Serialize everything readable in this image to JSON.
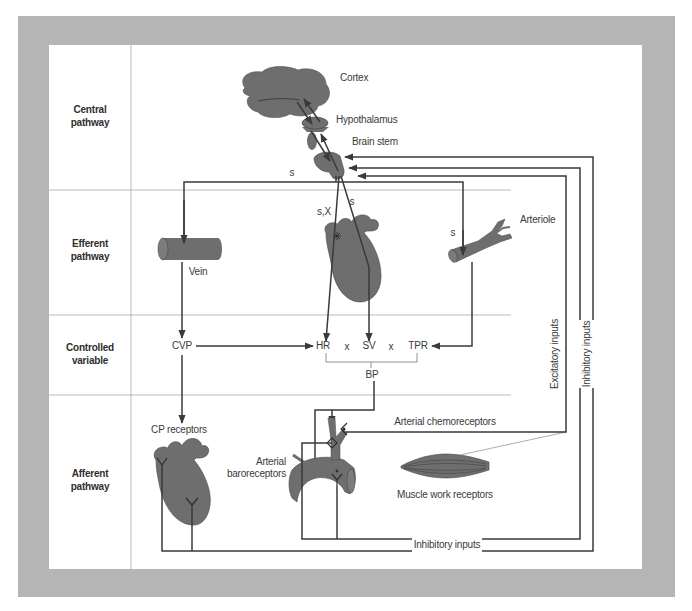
{
  "rows": [
    {
      "line1": "Central",
      "line2": "pathway"
    },
    {
      "line1": "Efferent",
      "line2": "pathway"
    },
    {
      "line1": "Controlled",
      "line2": "variable"
    },
    {
      "line1": "Afferent",
      "line2": "pathway"
    }
  ],
  "central": {
    "cortex": "Cortex",
    "hypothalamus": "Hypothalamus",
    "brain_stem": "Brain stem",
    "sympathetic_label": "s"
  },
  "efferent": {
    "vein": "Vein",
    "arteriole": "Arteriole",
    "heart_rate_nerve_label": "s,X",
    "stroke_volume_nerve_label": "s",
    "arteriole_nerve_label": "s"
  },
  "controlled": {
    "cvp": "CVP",
    "hr": "HR",
    "times_1": "x",
    "sv": "SV",
    "times_2": "x",
    "tpr": "TPR",
    "bp": "BP"
  },
  "afferent": {
    "cp_receptors": "CP receptors",
    "chemoreceptors": "Arterial chemoreceptors",
    "baroreceptors_line1": "Arterial",
    "baroreceptors_line2": "baroreceptors",
    "muscle_receptors": "Muscle work receptors",
    "inhibitory_inputs_bottom": "Inhibitory inputs"
  },
  "inputs": {
    "excitatory": "Excitatory inputs",
    "inhibitory": "Inhibitory inputs"
  },
  "colors": {
    "frame": "#b5b5b5",
    "panel": "#ffffff",
    "organ_fill": "#6e6e6e",
    "line": "#3a3a3a",
    "divider": "#a8a8a8",
    "text": "#3a3a3a"
  }
}
